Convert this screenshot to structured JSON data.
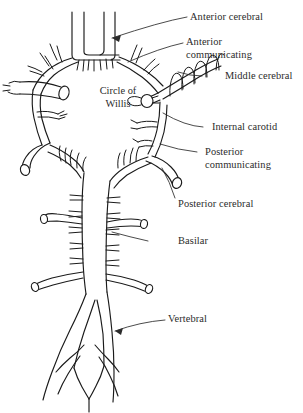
{
  "figure": {
    "title": "Circle of Willis",
    "ink_color": "#1a1a1a",
    "text_color": "#2b2b2b",
    "background_color": "#ffffff"
  },
  "center_label": {
    "line1": "Circle of",
    "line2": "Willis"
  },
  "labels": [
    {
      "id": "anterior-cerebral",
      "text": "Anterior cerebral"
    },
    {
      "id": "anterior-communicating",
      "line1": "Anterior",
      "line2": "communicating"
    },
    {
      "id": "middle-cerebral",
      "text": "Middle cerebral"
    },
    {
      "id": "internal-carotid",
      "text": "Internal carotid"
    },
    {
      "id": "posterior-communicating",
      "line1": "Posterior",
      "line2": "communicating"
    },
    {
      "id": "posterior-cerebral",
      "text": "Posterior cerebral"
    },
    {
      "id": "basilar",
      "text": "Basilar"
    },
    {
      "id": "vertebral",
      "text": "Vertebral"
    }
  ]
}
